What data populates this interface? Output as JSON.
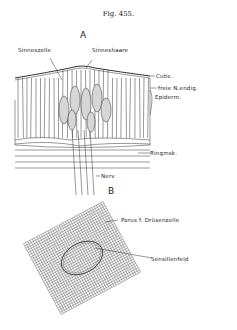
{
  "figure": {
    "title": "Fig. 455.",
    "panel_a": {
      "label": "A",
      "annotations": {
        "sinneszelle": "Sinneszelle",
        "sinneshaare": "Sinneshaare",
        "cuticula": "Cutic.",
        "freie_nervenendigung": "freie N.endig.",
        "epidermis": "Epiderm.",
        "ringmuskel": "Ringmsk.",
        "nerv": "Nerv"
      }
    },
    "panel_b": {
      "label": "B",
      "annotations": {
        "porus": "Porus f. Drüsenzelle",
        "sensillenfeld": "Sensillenfeld"
      }
    }
  }
}
